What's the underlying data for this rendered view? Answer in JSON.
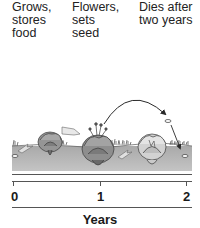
{
  "diagram": {
    "type": "biennial-plant-life-cycle",
    "stages": [
      {
        "lines": [
          "Grows,",
          "stores",
          "food"
        ],
        "year_position": 0.25
      },
      {
        "lines": [
          "Flowers,",
          "sets",
          "seed"
        ],
        "year_position": 1.0
      },
      {
        "lines": [
          "Dies after",
          "two years"
        ],
        "year_position": 1.75
      }
    ],
    "axis": {
      "title": "Years",
      "ticks": [
        {
          "value": 0,
          "label": "0"
        },
        {
          "value": 1,
          "label": "1"
        },
        {
          "value": 2,
          "label": "2"
        }
      ],
      "range": [
        0,
        2
      ]
    },
    "illustration": {
      "elements": [
        "seed-year-0",
        "sprout-arrow",
        "rosette-plant-year-0-1",
        "growth-arrow",
        "flowering-plant-year-1",
        "seed-dispersal-arc-arrow",
        "dying-plant-year-1-2",
        "falling-seed",
        "new-seed-year-2"
      ]
    },
    "colors": {
      "soil": "#b8b8b8",
      "soil_dark": "#9a9a9a",
      "plant_stroke": "#3a3a3a",
      "plant_fill": "#8c8c8c",
      "arrow": "#2a2a2a",
      "axis": "#555555",
      "text": "#1a1a1a"
    }
  }
}
